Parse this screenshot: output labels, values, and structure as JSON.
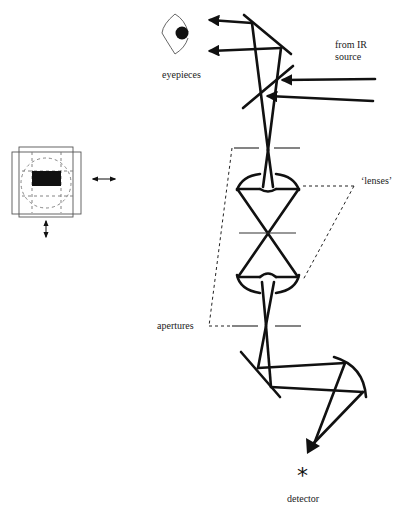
{
  "labels": {
    "eyepieces": "eyepieces",
    "ir_source_line1": "from IR",
    "ir_source_line2": "source",
    "lenses": "‘lenses’",
    "apertures": "apertures",
    "detector": "detector",
    "detector_symbol": "*"
  },
  "icons": {
    "eye": "eye-icon",
    "detector": "asterisk-icon",
    "aperture_inset": "aperture-slit-icon",
    "horizontal_arrow": "double-arrow-horizontal-icon",
    "vertical_arrow": "double-arrow-vertical-icon"
  },
  "colors": {
    "ink": "#111111",
    "background": "#ffffff"
  }
}
